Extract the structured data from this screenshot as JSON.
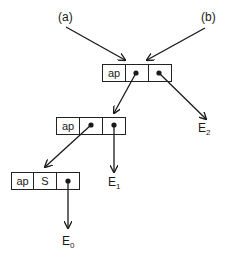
{
  "labels": {
    "a": "(a)",
    "b": "(b)",
    "e0": {
      "base": "E",
      "sub": "0"
    },
    "e1": {
      "base": "E",
      "sub": "1"
    },
    "e2": {
      "base": "E",
      "sub": "2"
    }
  },
  "nodes": {
    "top": {
      "cells": [
        "ap",
        "",
        ""
      ]
    },
    "middle": {
      "cells": [
        "ap",
        "",
        ""
      ]
    },
    "bottom": {
      "cells": [
        "ap",
        "S",
        ""
      ]
    }
  },
  "colors": {
    "line": "#1a1a1a",
    "background": "#ffffff"
  }
}
